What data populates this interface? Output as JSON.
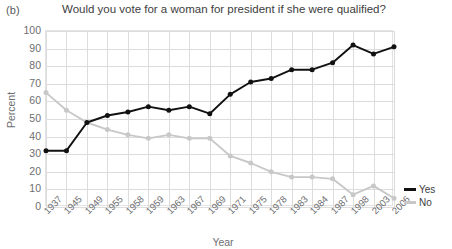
{
  "panel": {
    "label": "(b)"
  },
  "chart_data": {
    "type": "line",
    "title": "Would you vote for a woman for president if she were qualified?",
    "xlabel": "Year",
    "ylabel": "Percent",
    "ylim": [
      0,
      100
    ],
    "ytick_step": 10,
    "yticks": [
      100,
      90,
      80,
      70,
      60,
      50,
      40,
      30,
      20,
      10,
      0
    ],
    "grid": true,
    "legend_position": "right",
    "categories": [
      "1937",
      "1945",
      "1949",
      "1955",
      "1958",
      "1959",
      "1963",
      "1967",
      "1969",
      "1971",
      "1975",
      "1978",
      "1983",
      "1984",
      "1987",
      "1998",
      "2003",
      "2006"
    ],
    "series": [
      {
        "name": "Yes",
        "color": "#111111",
        "values": [
          32,
          32,
          48,
          52,
          54,
          57,
          55,
          57,
          53,
          64,
          71,
          73,
          78,
          78,
          82,
          92,
          87,
          91
        ]
      },
      {
        "name": "No",
        "color": "#c8c8c8",
        "values": [
          65,
          55,
          48,
          44,
          41,
          39,
          41,
          39,
          39,
          29,
          25,
          20,
          17,
          17,
          16,
          7,
          12,
          5
        ]
      }
    ]
  },
  "legend": {
    "items": [
      {
        "label": "Yes",
        "color": "#111111"
      },
      {
        "label": "No",
        "color": "#c8c8c8"
      }
    ]
  }
}
